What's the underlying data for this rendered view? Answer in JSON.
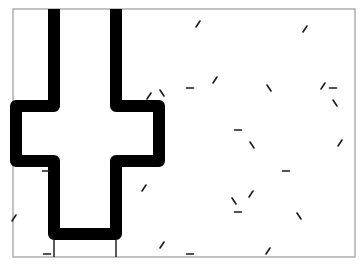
{
  "stimulus": {
    "title": "Path stimulus with distractor line segments",
    "frame": {
      "x": 13,
      "y": 9,
      "width": 342,
      "height": 248,
      "stroke": "#9a9a9a"
    },
    "path": {
      "color": "#000000",
      "stroke_width": 12,
      "points": [
        [
          54,
          9
        ],
        [
          54,
          106
        ],
        [
          16,
          106
        ],
        [
          16,
          161
        ],
        [
          54,
          161
        ],
        [
          54,
          234
        ],
        [
          116,
          234
        ],
        [
          116,
          161
        ],
        [
          159,
          161
        ],
        [
          159,
          106
        ],
        [
          116,
          106
        ],
        [
          116,
          9
        ]
      ]
    },
    "exit_lines": [
      {
        "x1": 54,
        "y1": 240,
        "x2": 54,
        "y2": 257
      },
      {
        "x1": 116,
        "y1": 240,
        "x2": 116,
        "y2": 257
      }
    ],
    "segments": [
      {
        "type": "diag-up",
        "x": 198,
        "y": 24
      },
      {
        "type": "diag-up",
        "x": 305,
        "y": 29
      },
      {
        "type": "diag-up",
        "x": 149,
        "y": 96
      },
      {
        "type": "diag-down",
        "x": 162,
        "y": 93
      },
      {
        "type": "horizontal",
        "x": 190,
        "y": 88
      },
      {
        "type": "diag-up",
        "x": 215,
        "y": 80
      },
      {
        "type": "diag-down",
        "x": 269,
        "y": 88
      },
      {
        "type": "diag-up",
        "x": 323,
        "y": 86
      },
      {
        "type": "horizontal",
        "x": 333,
        "y": 88
      },
      {
        "type": "diag-down",
        "x": 335,
        "y": 103
      },
      {
        "type": "diag-up",
        "x": 340,
        "y": 143
      },
      {
        "type": "horizontal",
        "x": 238,
        "y": 130
      },
      {
        "type": "diag-down",
        "x": 252,
        "y": 145
      },
      {
        "type": "horizontal",
        "x": 286,
        "y": 171
      },
      {
        "type": "diag-up",
        "x": 251,
        "y": 194
      },
      {
        "type": "diag-down",
        "x": 234,
        "y": 201
      },
      {
        "type": "horizontal",
        "x": 238,
        "y": 212
      },
      {
        "type": "diag-down",
        "x": 299,
        "y": 216
      },
      {
        "type": "diag-up",
        "x": 144,
        "y": 188
      },
      {
        "type": "diag-up",
        "x": 162,
        "y": 245
      },
      {
        "type": "horizontal",
        "x": 190,
        "y": 254
      },
      {
        "type": "diag-up",
        "x": 268,
        "y": 251
      },
      {
        "type": "horizontal",
        "x": 46,
        "y": 171
      },
      {
        "type": "diag-up",
        "x": 14,
        "y": 218
      },
      {
        "type": "horizontal",
        "x": 47,
        "y": 254
      }
    ],
    "segment_color": "#1a1a1a"
  }
}
